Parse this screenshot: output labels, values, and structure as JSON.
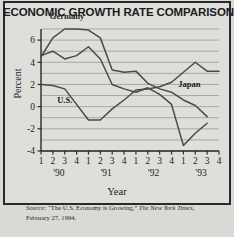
{
  "figure": {
    "title": "ECONOMIC GROWTH RATE COMPARISONS",
    "background_color": "#d9d9d6",
    "border_color": "#2a2a2a",
    "line_color": "#4a4a4a",
    "grid_color": "#9a9a96"
  },
  "source": {
    "label": "Source:",
    "article": "“The U.S. Economy is Growing,”",
    "publication": "The New York Times",
    "date": ", February 27, 1994."
  },
  "chart_data": {
    "type": "line",
    "title": "ECONOMIC GROWTH RATE COMPARISONS",
    "xlabel": "Year",
    "ylabel": "Percent",
    "ylim": [
      -4,
      7
    ],
    "yticks": [
      -4,
      -2,
      0,
      2,
      4,
      6
    ],
    "ytick_labels": [
      "-4",
      "-2",
      "0",
      "2",
      "4",
      "6"
    ],
    "gridlines": [
      -4,
      -3,
      -2,
      -1,
      0,
      1,
      2,
      3,
      4,
      5,
      6,
      7
    ],
    "grid": true,
    "legend": "inline-labels",
    "x": [
      "1",
      "2",
      "3",
      "4",
      "1",
      "2",
      "3",
      "4",
      "1",
      "2",
      "3",
      "4",
      "1",
      "2",
      "3",
      "4"
    ],
    "quarter_labels": [
      "1",
      "2",
      "3",
      "4",
      "1",
      "2",
      "3",
      "4",
      "1",
      "2",
      "3",
      "4",
      "1",
      "2",
      "3",
      "4"
    ],
    "year_groups": [
      "'90",
      "'91",
      "'92",
      "'93"
    ],
    "series": [
      {
        "name": "Germany",
        "values": [
          4.5,
          6.2,
          7.0,
          7.0,
          6.9,
          6.2,
          3.3,
          3.1,
          3.2,
          2.1,
          1.6,
          1.3,
          0.6,
          0.1,
          -0.9,
          null
        ]
      },
      {
        "name": "U.S.",
        "values": [
          2.0,
          1.9,
          1.6,
          0.2,
          -1.2,
          -1.2,
          -0.2,
          0.6,
          1.5,
          1.6,
          1.8,
          2.2,
          3.1,
          4.0,
          3.2,
          3.2
        ]
      },
      {
        "name": "Japan",
        "values": [
          4.6,
          5.0,
          4.3,
          4.6,
          5.4,
          4.3,
          2.0,
          1.6,
          1.3,
          1.7,
          1.1,
          0.2,
          -3.5,
          -2.4,
          -1.5,
          null
        ]
      }
    ],
    "annotations": [
      {
        "text": "Germany",
        "x_index": 2.2,
        "y": 7.9
      },
      {
        "text": "U.S.",
        "x_index": 2.0,
        "y": 0.35
      },
      {
        "text": "Japan",
        "x_index": 12.5,
        "y": 1.75
      }
    ]
  }
}
